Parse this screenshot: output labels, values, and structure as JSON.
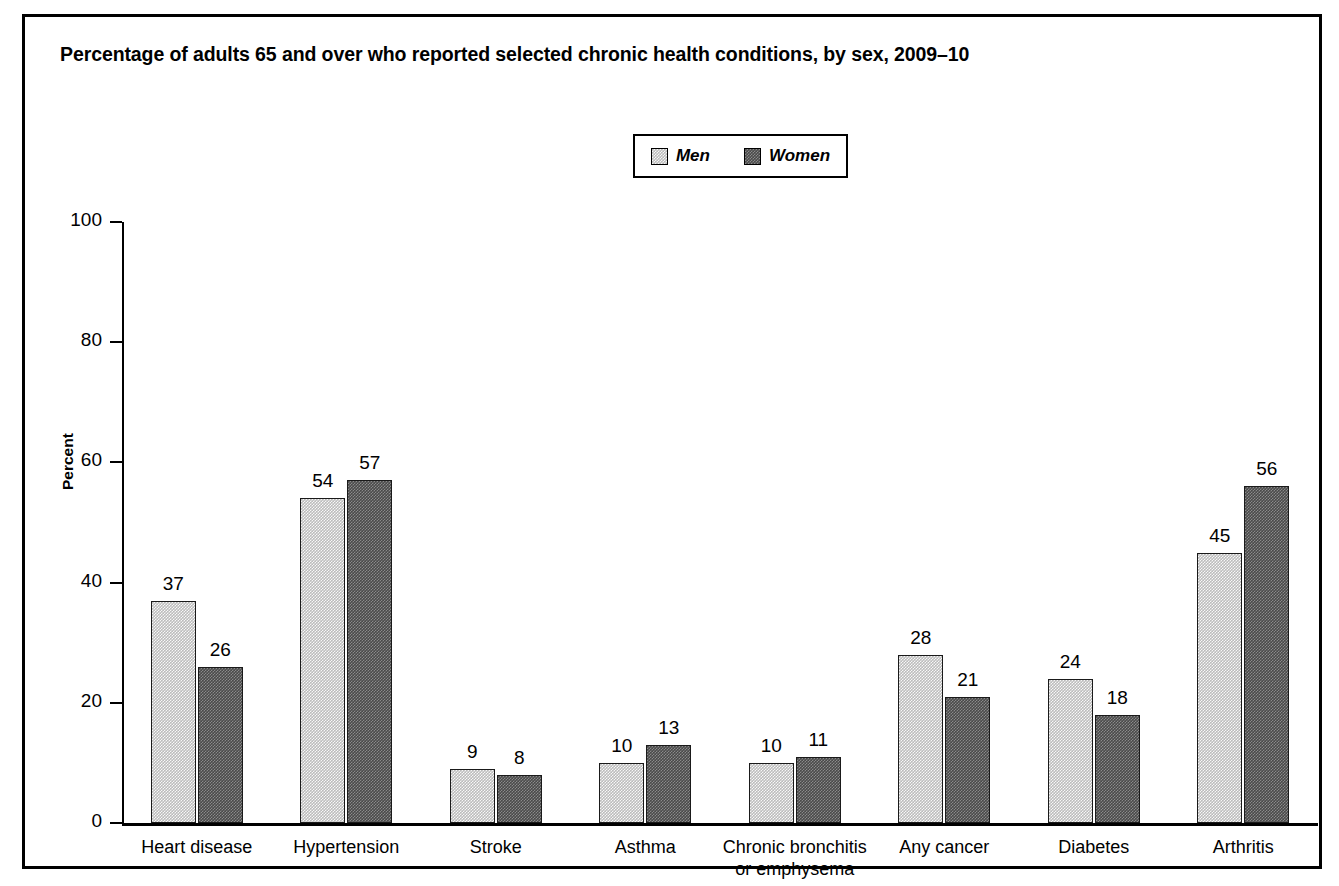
{
  "title": "Percentage of adults 65 and over who reported selected chronic health conditions, by sex, 2009–10",
  "note": "Note: Data are based on a 2-year average from 2009–2010.",
  "legend": {
    "men_label": "Men",
    "women_label": "Women",
    "men_color": "#bcbcbc",
    "women_color": "#4a4a4a"
  },
  "axis": {
    "ylabel": "Percent",
    "yticks": [
      "0",
      "20",
      "40",
      "60",
      "80",
      "100"
    ]
  },
  "chart_data": {
    "type": "bar",
    "title": "Percentage of adults 65 and over who reported selected chronic health conditions, by sex, 2009–10",
    "xlabel": "",
    "ylabel": "Percent",
    "ylim": [
      0,
      100
    ],
    "yticks": [
      0,
      20,
      40,
      60,
      80,
      100
    ],
    "grid": false,
    "legend_position": "top-center",
    "categories": [
      "Heart disease",
      "Hypertension",
      "Stroke",
      "Asthma",
      "Chronic bronchitis\nor emphysema",
      "Any cancer",
      "Diabetes",
      "Arthritis"
    ],
    "series": [
      {
        "name": "Men",
        "color": "#bcbcbc",
        "values": [
          37,
          54,
          9,
          10,
          10,
          28,
          24,
          45
        ]
      },
      {
        "name": "Women",
        "color": "#4a4a4a",
        "values": [
          26,
          57,
          8,
          13,
          11,
          21,
          18,
          56
        ]
      }
    ]
  }
}
